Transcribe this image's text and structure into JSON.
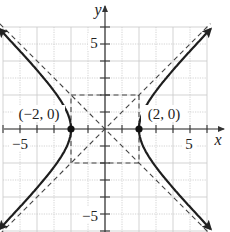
{
  "chart_data": {
    "type": "line",
    "title": "",
    "equation": "x^2/4 - y^2/4 = 1",
    "xlabel": "x",
    "ylabel": "y",
    "xlim": [
      -6,
      7
    ],
    "ylim": [
      -6,
      7.5
    ],
    "grid": true,
    "x_tick_labels": [
      {
        "value": -5,
        "label": "−5"
      },
      {
        "value": 5,
        "label": "5"
      }
    ],
    "y_tick_labels": [
      {
        "value": 5,
        "label": "5"
      },
      {
        "value": -5,
        "label": "−5"
      }
    ],
    "series": [
      {
        "name": "right branch",
        "style": "solid",
        "points": [
          [
            6,
            5.657
          ],
          [
            5,
            4.583
          ],
          [
            4,
            3.464
          ],
          [
            3,
            2.236
          ],
          [
            2.5,
            1.5
          ],
          [
            2,
            0
          ],
          [
            2.5,
            -1.5
          ],
          [
            3,
            -2.236
          ],
          [
            4,
            -3.464
          ],
          [
            5,
            -4.583
          ],
          [
            6,
            -5.657
          ]
        ]
      },
      {
        "name": "left branch",
        "style": "solid",
        "points": [
          [
            -6,
            5.657
          ],
          [
            -5,
            4.583
          ],
          [
            -4,
            3.464
          ],
          [
            -3,
            2.236
          ],
          [
            -2.5,
            1.5
          ],
          [
            -2,
            0
          ],
          [
            -2.5,
            -1.5
          ],
          [
            -3,
            -2.236
          ],
          [
            -4,
            -3.464
          ],
          [
            -5,
            -4.583
          ],
          [
            -6,
            -5.657
          ]
        ]
      },
      {
        "name": "asymptote y = x",
        "style": "dashed",
        "points": [
          [
            -6.2,
            -6.2
          ],
          [
            6.2,
            6.2
          ]
        ]
      },
      {
        "name": "asymptote y = -x",
        "style": "dashed",
        "points": [
          [
            -6.2,
            6.2
          ],
          [
            6.2,
            -6.2
          ]
        ]
      },
      {
        "name": "central rectangle",
        "style": "dashed",
        "points": [
          [
            -2,
            2
          ],
          [
            2,
            2
          ],
          [
            2,
            -2
          ],
          [
            -2,
            -2
          ],
          [
            -2,
            2
          ]
        ]
      }
    ],
    "annotations": [
      {
        "point": [
          -2,
          0
        ],
        "label": "(−2, 0)"
      },
      {
        "point": [
          2,
          0
        ],
        "label": "(2, 0)"
      }
    ]
  }
}
